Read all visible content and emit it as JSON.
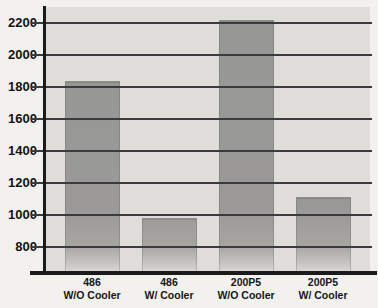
{
  "chart_data": {
    "type": "bar",
    "title": "",
    "xlabel": "",
    "ylabel": "",
    "categories": [
      {
        "line1": "486",
        "line2": "W/O Cooler"
      },
      {
        "line1": "486",
        "line2": "W/ Cooler"
      },
      {
        "line1": "200P5",
        "line2": "W/O Cooler"
      },
      {
        "line1": "200P5",
        "line2": "W/ Cooler"
      }
    ],
    "values": [
      1840,
      980,
      2220,
      1110
    ],
    "yticks": [
      2200,
      2000,
      1800,
      1600,
      1400,
      1200,
      1000,
      800
    ],
    "ylim": [
      670,
      2300
    ],
    "grid": true,
    "legend": false,
    "colors": {
      "bar": "#9b9a98",
      "plot_background": "#deddda",
      "page_background": "#f2f1ee",
      "gridline": "#3b3a3c",
      "axis": "#1b1b1b",
      "label": "#141414"
    }
  }
}
